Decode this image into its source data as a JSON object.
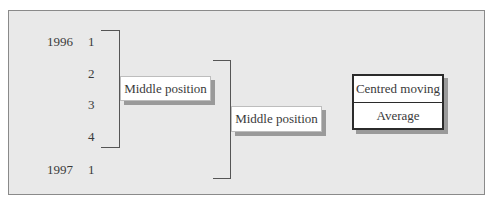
{
  "rows": [
    {
      "year": "1996",
      "quarter": "1"
    },
    {
      "year": "",
      "quarter": "2"
    },
    {
      "year": "",
      "quarter": "3"
    },
    {
      "year": "",
      "quarter": "4"
    },
    {
      "year": "1997",
      "quarter": "1"
    }
  ],
  "first_middle": {
    "label": "Middle position"
  },
  "second_middle": {
    "label": "Middle position"
  },
  "centred_box": {
    "line1": "Centred moving",
    "line2": "Average"
  }
}
